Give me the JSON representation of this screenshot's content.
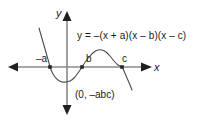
{
  "figure": {
    "background_color": "#ffffff",
    "width": 206,
    "height": 125
  },
  "axes": {
    "color": "#8a8a8a",
    "x_label": "x",
    "y_label": "y"
  },
  "equation": {
    "text": "y = –(x + a)(x – b)(x – c)",
    "clipped_at_right_edge": true
  },
  "labels": {
    "root_a": "–a",
    "root_b": "b",
    "root_c": "c",
    "y_intercept": "(0, –abc)"
  },
  "chart_data": {
    "type": "line",
    "title": "",
    "xlabel": "x",
    "ylabel": "y",
    "curve_color": "#4a4a4a",
    "marker_color": "#262626",
    "grid": false,
    "legend": "none",
    "annotations": [
      {
        "name": "equation",
        "text": "y = –(x + a)(x – b)(x – c)"
      },
      {
        "name": "root-a-label",
        "text": "–a"
      },
      {
        "name": "root-b-label",
        "text": "b"
      },
      {
        "name": "root-c-label",
        "text": "c"
      },
      {
        "name": "y-intercept-label",
        "text": "(0, –abc)"
      }
    ],
    "roots_px": [
      50,
      82,
      122
    ],
    "origin_px": {
      "x": 67,
      "y": 67
    },
    "series": [
      {
        "name": "y = -(x + a)(x - b)(x - c)",
        "points_px": [
          [
            39,
            28
          ],
          [
            41,
            35
          ],
          [
            43,
            42
          ],
          [
            45,
            49
          ],
          [
            47,
            56
          ],
          [
            49,
            63
          ],
          [
            50,
            67
          ],
          [
            52,
            72
          ],
          [
            55,
            77
          ],
          [
            58,
            80
          ],
          [
            62,
            82
          ],
          [
            66,
            82
          ],
          [
            70,
            81
          ],
          [
            74,
            78
          ],
          [
            78,
            73
          ],
          [
            82,
            67
          ],
          [
            86,
            61
          ],
          [
            90,
            56
          ],
          [
            94,
            52
          ],
          [
            98,
            50
          ],
          [
            102,
            50
          ],
          [
            106,
            52
          ],
          [
            110,
            56
          ],
          [
            114,
            61
          ],
          [
            118,
            65
          ],
          [
            122,
            67
          ],
          [
            124,
            71
          ],
          [
            127,
            78
          ],
          [
            130,
            85
          ],
          [
            132,
            90
          ]
        ]
      }
    ]
  }
}
